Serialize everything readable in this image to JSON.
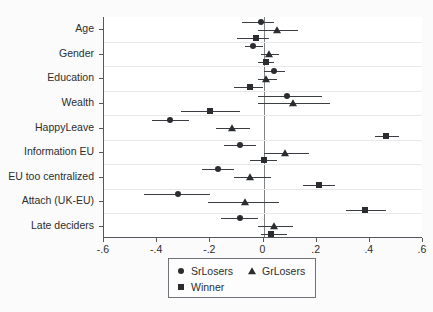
{
  "chart_data": {
    "type": "scatter",
    "title": "",
    "subtitle": "",
    "xlabel": "",
    "ylabel": "",
    "xlim": [
      -0.6,
      0.6
    ],
    "xticks": [
      -0.6,
      -0.4,
      -0.2,
      0,
      0.2,
      0.4,
      0.6
    ],
    "xticklabels": [
      "-.6",
      "-.4",
      "-.2",
      "0",
      ".2",
      ".4",
      ".6"
    ],
    "grid": "horizontal",
    "reference_line": 0,
    "legend_position": "bottom-center",
    "categories": [
      "Age",
      "Gender",
      "Education",
      "Wealth",
      "HappyLeave",
      "Information EU",
      "EU too centralized",
      "Attach (UK-EU)",
      "Late deciders"
    ],
    "series": [
      {
        "name": "SrLosers",
        "marker": "circle",
        "values": [
          -0.01,
          -0.04,
          0.04,
          0.09,
          -0.35,
          -0.09,
          -0.17,
          -0.32,
          -0.09
        ],
        "ci_low": [
          -0.08,
          -0.07,
          0.0,
          -0.02,
          -0.42,
          -0.15,
          -0.23,
          -0.45,
          -0.16
        ],
        "ci_high": [
          0.04,
          0.0,
          0.08,
          0.22,
          -0.28,
          -0.03,
          -0.11,
          -0.2,
          -0.02
        ]
      },
      {
        "name": "GrLosers",
        "marker": "triangle",
        "values": [
          0.05,
          0.02,
          0.01,
          0.11,
          -0.12,
          0.08,
          -0.05,
          -0.07,
          0.04
        ],
        "ci_low": [
          -0.02,
          -0.01,
          -0.02,
          -0.02,
          -0.18,
          0.0,
          -0.11,
          -0.21,
          -0.02
        ],
        "ci_high": [
          0.13,
          0.06,
          0.05,
          0.25,
          -0.05,
          0.17,
          0.03,
          0.06,
          0.11
        ]
      },
      {
        "name": "Winner",
        "marker": "square",
        "values": [
          -0.03,
          0.01,
          -0.05,
          -0.2,
          0.46,
          0.0,
          0.21,
          0.38,
          0.03
        ],
        "ci_low": [
          -0.1,
          -0.02,
          -0.11,
          -0.31,
          0.42,
          -0.05,
          0.15,
          0.31,
          -0.01
        ],
        "ci_high": [
          0.02,
          0.04,
          0.0,
          -0.09,
          0.51,
          0.05,
          0.27,
          0.46,
          0.09
        ]
      }
    ]
  },
  "legend": {
    "entries": [
      {
        "label": "SrLosers",
        "marker": "circle"
      },
      {
        "label": "GrLosers",
        "marker": "triangle"
      },
      {
        "label": "Winner",
        "marker": "square"
      }
    ]
  },
  "colors": {
    "marker": "#2a2c2f",
    "ci": "#3a3d41",
    "axis": "#55585c",
    "grid": "#e9e9ea",
    "zero_line": "#7f8287",
    "background": "#ffffff"
  }
}
